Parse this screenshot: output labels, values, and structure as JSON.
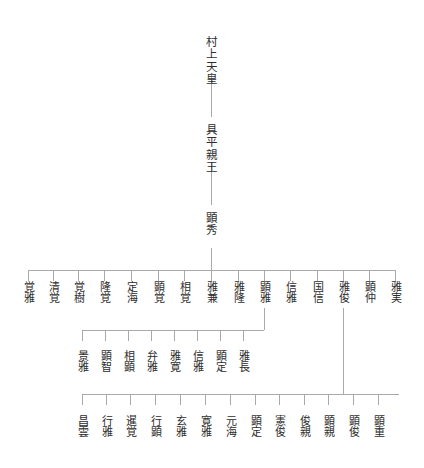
{
  "diagram": {
    "type": "genealogy-tree",
    "title": "",
    "orientation": "vertical-text-top-down",
    "line_color": "#a9a9a9",
    "text_color": "#2d2d2d",
    "generations": [
      {
        "level": 1,
        "nodes": [
          {
            "id": "g1n1",
            "label": "村上天皇",
            "x": 211,
            "y": 36
          }
        ]
      },
      {
        "level": 2,
        "nodes": [
          {
            "id": "g2n1",
            "label": "具平親王",
            "x": 211,
            "y": 124
          }
        ]
      },
      {
        "level": 3,
        "nodes": [
          {
            "id": "g3n1",
            "label": "顕秀",
            "x": 211,
            "y": 212
          }
        ]
      },
      {
        "level": 4,
        "nodes": [
          {
            "id": "g4n1",
            "label": "覚雅",
            "x": 28,
            "y": 281
          },
          {
            "id": "g4n2",
            "label": "清覚",
            "x": 53,
            "y": 281
          },
          {
            "id": "g4n3",
            "label": "覚樹",
            "x": 78,
            "y": 281
          },
          {
            "id": "g4n4",
            "label": "隆覚",
            "x": 104,
            "y": 281
          },
          {
            "id": "g4n5",
            "label": "定海",
            "x": 131,
            "y": 281
          },
          {
            "id": "g4n6",
            "label": "顕覚",
            "x": 158,
            "y": 281
          },
          {
            "id": "g4n7",
            "label": "相覚",
            "x": 184,
            "y": 281
          },
          {
            "id": "g4n8",
            "label": "雅兼",
            "x": 211,
            "y": 281
          },
          {
            "id": "g4n9",
            "label": "雅隆",
            "x": 238,
            "y": 281
          },
          {
            "id": "g4n10",
            "label": "顕雅",
            "x": 264,
            "y": 281
          },
          {
            "id": "g4n11",
            "label": "信雅",
            "x": 290,
            "y": 281
          },
          {
            "id": "g4n12",
            "label": "国信",
            "x": 317,
            "y": 281
          },
          {
            "id": "g4n13",
            "label": "雅俊",
            "x": 343,
            "y": 281
          },
          {
            "id": "g4n14",
            "label": "顕仲",
            "x": 369,
            "y": 281
          },
          {
            "id": "g4n15",
            "label": "雅実",
            "x": 395,
            "y": 281
          }
        ]
      },
      {
        "level": 5,
        "nodes": [
          {
            "id": "g5n1",
            "label": "景雅",
            "x": 82,
            "y": 350
          },
          {
            "id": "g5n2",
            "label": "顕智",
            "x": 105,
            "y": 350
          },
          {
            "id": "g5n3",
            "label": "相顕",
            "x": 128,
            "y": 350
          },
          {
            "id": "g5n4",
            "label": "弁雅",
            "x": 151,
            "y": 350
          },
          {
            "id": "g5n5",
            "label": "雅寛",
            "x": 174,
            "y": 350
          },
          {
            "id": "g5n6",
            "label": "信雅",
            "x": 197,
            "y": 350
          },
          {
            "id": "g5n7",
            "label": "顕定",
            "x": 220,
            "y": 350
          },
          {
            "id": "g5n8",
            "label": "雅長",
            "x": 243,
            "y": 350
          }
        ]
      },
      {
        "level": 6,
        "nodes": [
          {
            "id": "g6n1",
            "label": "昌雲",
            "x": 82,
            "y": 415
          },
          {
            "id": "g6n2",
            "label": "行雅",
            "x": 106,
            "y": 415
          },
          {
            "id": "g6n3",
            "label": "暹覚",
            "x": 130,
            "y": 415
          },
          {
            "id": "g6n4",
            "label": "行顕",
            "x": 155,
            "y": 415
          },
          {
            "id": "g6n5",
            "label": "玄雅",
            "x": 180,
            "y": 415
          },
          {
            "id": "g6n6",
            "label": "寛雅",
            "x": 205,
            "y": 415
          },
          {
            "id": "g6n7",
            "label": "元海",
            "x": 230,
            "y": 415
          },
          {
            "id": "g6n8",
            "label": "顕定",
            "x": 255,
            "y": 415
          },
          {
            "id": "g6n9",
            "label": "憲俊",
            "x": 279,
            "y": 415
          },
          {
            "id": "g6n10",
            "label": "俊親",
            "x": 304,
            "y": 415
          },
          {
            "id": "g6n11",
            "label": "顕親",
            "x": 328,
            "y": 415
          },
          {
            "id": "g6n12",
            "label": "顕俊",
            "x": 353,
            "y": 415
          },
          {
            "id": "g6n13",
            "label": "顕重",
            "x": 378,
            "y": 415
          }
        ]
      }
    ],
    "connectors": {
      "stems": [
        {
          "name": "murakami-to-tomohira",
          "x": 211,
          "y": 75,
          "height": 42
        },
        {
          "name": "tomohira-to-akihide",
          "x": 211,
          "y": 163,
          "height": 42
        },
        {
          "name": "akihide-to-bus4",
          "x": 211,
          "y": 248,
          "height": 22
        },
        {
          "name": "akimasa-to-bus5",
          "x": 264,
          "y": 308,
          "height": 22
        },
        {
          "name": "masatoshi-to-bus6",
          "x": 343,
          "y": 308,
          "height": 86
        }
      ],
      "buses": [
        {
          "name": "generation-4-bus",
          "y": 270,
          "x1": 28,
          "x2": 395
        },
        {
          "name": "generation-5-bus",
          "y": 330,
          "x1": 82,
          "x2": 264
        },
        {
          "name": "generation-6-bus",
          "y": 394,
          "x1": 82,
          "x2": 399
        }
      ],
      "drops": {
        "generation_4": {
          "y": 270,
          "height": 11,
          "xs": [
            28,
            53,
            78,
            104,
            131,
            158,
            184,
            211,
            238,
            264,
            290,
            317,
            343,
            369,
            395
          ]
        },
        "generation_5": {
          "y": 330,
          "height": 11,
          "xs": [
            82,
            105,
            128,
            151,
            174,
            197,
            220,
            243
          ]
        },
        "generation_6": {
          "y": 394,
          "height": 11,
          "xs": [
            82,
            106,
            130,
            155,
            180,
            205,
            230,
            255,
            279,
            304,
            328,
            353,
            378
          ]
        }
      }
    }
  }
}
